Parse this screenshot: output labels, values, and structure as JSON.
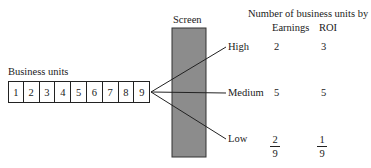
{
  "business_units": {
    "label": "Business units",
    "units": [
      "1",
      "2",
      "3",
      "4",
      "5",
      "6",
      "7",
      "8",
      "9"
    ]
  },
  "screen": {
    "label": "Screen",
    "fill_color": "#8c8c8c"
  },
  "outcomes": [
    {
      "label": "High"
    },
    {
      "label": "Medium"
    },
    {
      "label": "Low"
    }
  ],
  "table": {
    "title": "Number of business units by",
    "columns": [
      "Earnings",
      "ROI"
    ],
    "rows": [
      {
        "level": "High",
        "earnings": "2",
        "roi": "3"
      },
      {
        "level": "Medium",
        "earnings": "5",
        "roi": "5"
      },
      {
        "level": "Low",
        "earnings": {
          "numerator": "2",
          "denominator": "9"
        },
        "roi": {
          "numerator": "1",
          "denominator": "9"
        }
      }
    ]
  }
}
